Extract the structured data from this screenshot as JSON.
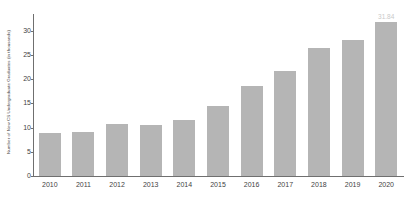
{
  "chart_data": {
    "type": "bar",
    "title": "",
    "xlabel": "",
    "ylabel": "Number of New CS Undergraduate Graduates (in thousands)",
    "categories": [
      "2010",
      "2011",
      "2012",
      "2013",
      "2014",
      "2015",
      "2016",
      "2017",
      "2018",
      "2019",
      "2020"
    ],
    "values": [
      8.8,
      9.2,
      10.8,
      10.5,
      11.6,
      14.5,
      18.6,
      21.8,
      26.4,
      28.1,
      31.84
    ],
    "ylim": [
      0,
      33.5
    ],
    "yticks": [
      0,
      5,
      10,
      15,
      20,
      25,
      30
    ],
    "ytick_labels": [
      "0",
      "5",
      "10",
      "15",
      "20",
      "25",
      "30"
    ],
    "grid": false,
    "legend": null,
    "bar_color": "#b5b5b5",
    "axis_color": "#6f6f6f",
    "text_color": "#3f3f3f",
    "annotations": [
      {
        "category": "2020",
        "text": "31.84",
        "color": "#c9c9c9"
      }
    ]
  }
}
